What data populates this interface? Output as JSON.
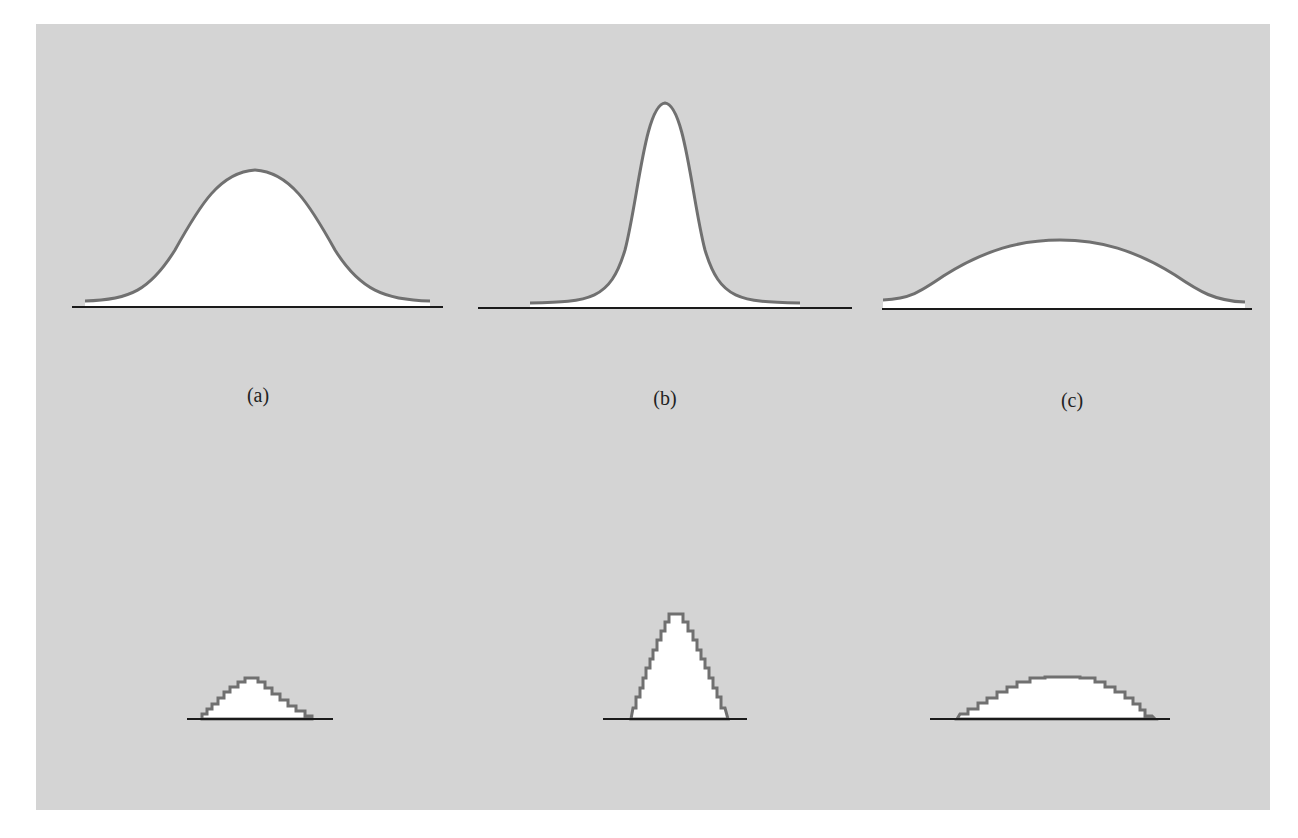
{
  "figure": {
    "labels": {
      "a": "(a)",
      "b": "(b)",
      "c": "(c)"
    },
    "colors": {
      "background": "#ffffff",
      "panel": "#d4d4d4",
      "curve_stroke": "#707070",
      "fill": "#ffffff",
      "baseline": "#1a1a1a"
    },
    "top_row": [
      {
        "id": "a",
        "type": "bell-curve",
        "description": "medium-width bell curve"
      },
      {
        "id": "b",
        "type": "bell-curve",
        "description": "narrow tall peaked curve"
      },
      {
        "id": "c",
        "type": "bell-curve",
        "description": "wide flat curve"
      }
    ],
    "bottom_row": [
      {
        "id": "a",
        "type": "step-histogram",
        "description": "small stepped triangle"
      },
      {
        "id": "b",
        "type": "step-histogram",
        "description": "tall stepped peak"
      },
      {
        "id": "c",
        "type": "step-histogram",
        "description": "wide flat stepped mound"
      }
    ]
  }
}
